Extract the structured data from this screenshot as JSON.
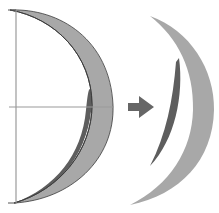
{
  "diagram": {
    "colors": {
      "background": "#ffffff",
      "axis_lines": "#9a9a9a",
      "outer_crescent_fill": "#a8a8a8",
      "inner_crescent_fill": "#5e5e5e",
      "outline": "#3a3a3a",
      "arrow": "#666666"
    },
    "elements": [
      {
        "name": "left-composite-crescent"
      },
      {
        "name": "vertical-axis"
      },
      {
        "name": "horizontal-axis"
      },
      {
        "name": "right-arrow-icon"
      },
      {
        "name": "outer-crescent-piece"
      },
      {
        "name": "inner-crescent-piece"
      }
    ]
  }
}
